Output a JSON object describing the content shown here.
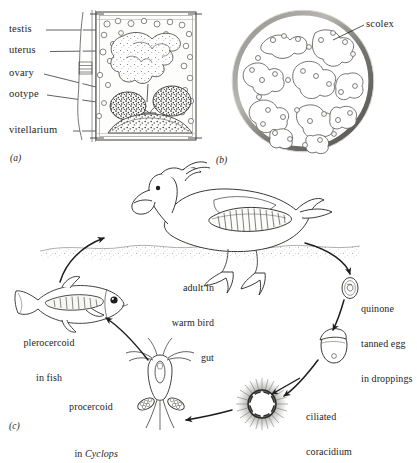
{
  "figure": {
    "panel_a_label": "(a)",
    "panel_b_label": "(b)",
    "panel_c_label": "(c)"
  },
  "panel_a": {
    "caption": "mature proglottid",
    "labels": [
      {
        "id": "testis",
        "text": "testis"
      },
      {
        "id": "uterus",
        "text": "uterus"
      },
      {
        "id": "ovary",
        "text": "ovary"
      },
      {
        "id": "ootype",
        "text": "ootype"
      },
      {
        "id": "vitellarium",
        "text": "vitellarium"
      }
    ]
  },
  "panel_b": {
    "caption": "cyst containing coiled worm",
    "labels": [
      {
        "id": "scolex",
        "text": "scolex"
      }
    ]
  },
  "panel_c": {
    "caption": "life cycle",
    "stages": [
      {
        "id": "adult",
        "text": "adult in\nwarm bird\ngut",
        "line1": "adult in",
        "line2": "warm bird",
        "line3": "gut"
      },
      {
        "id": "egg",
        "text": "quinone\ntanned egg\nin droppings",
        "line1": "quinone",
        "line2": "tanned egg",
        "line3": "in droppings"
      },
      {
        "id": "coracidium",
        "text": "ciliated\ncoracidium",
        "line1": "ciliated",
        "line2": "coracidium"
      },
      {
        "id": "procercoid",
        "line1": "procercoid",
        "line2_prefix": "in ",
        "line2_italic": "Cyclops"
      },
      {
        "id": "plerocercoid",
        "text": "plerocercoid\nin fish",
        "line1": "plerocercoid",
        "line2": "in fish"
      }
    ]
  },
  "colors": {
    "ink": "#1d1d1d",
    "line": "#2a2a2a",
    "fill_light": "#f2f1ee",
    "stipple": "#3a3a3a",
    "cyst_wall": "#6e6c68",
    "water": "#8a8a86"
  }
}
